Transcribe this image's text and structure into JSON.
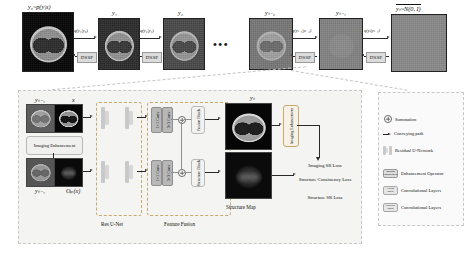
{
  "figure": {
    "top_row": {
      "states": [
        {
          "id": "y0",
          "label": "y₀~p(y|x)"
        },
        {
          "id": "y1",
          "label": "y₁"
        },
        {
          "id": "y2",
          "label": "y₂"
        },
        {
          "id": "yt2",
          "label": "yₜ₋₂"
        },
        {
          "id": "yt1",
          "label": "yₜ₋₁"
        },
        {
          "id": "yT",
          "label": "yₜ~N(0, I)"
        }
      ],
      "forward_labels": [
        "q(y₁|y₀)",
        "q(y₂|y₁)",
        "q(yₜ₋₁|yₜ₋₂)",
        "q(yₜ|yₜ₋₁)"
      ],
      "reverse_label": "DSSP",
      "reverse_labels": [
        "DSSP",
        "DSSP",
        "DSSP",
        "DSSP"
      ],
      "ellipsis": "•••"
    },
    "detail_panel": {
      "inputs": {
        "top_left_label": "yₜ₋₁",
        "top_right_label": "x",
        "bottom_left_label": "yₜ₋₁",
        "bottom_right_label": "Oₚ(x)",
        "enhancement_box": "Imaging Enhancement"
      },
      "stages": [
        {
          "name": "res-unet",
          "caption": "Res U-Net"
        },
        {
          "name": "feature-fusion",
          "caption": "Feature Fusion"
        },
        {
          "name": "structure-map",
          "caption": "Structure Map"
        }
      ],
      "conv_blocks": {
        "top": [
          "1×1 Conv",
          "3×3 Conv"
        ],
        "bottom": [
          "1×1 Conv",
          "3×3 Conv"
        ]
      },
      "fusion_blocks": {
        "top": "Fusion Block",
        "bottom": "Structure Block"
      },
      "output_label": "yₜ",
      "imaging_enhancement_vertical": "Imaging Enhancement",
      "losses": [
        "Imaging SR Loss",
        "Structure Consistency Loss",
        "Structure SR Loss"
      ]
    },
    "legend": {
      "items": [
        {
          "icon": "summation-icon",
          "label": "Summation"
        },
        {
          "icon": "arrow-icon",
          "label": "Conveying path"
        },
        {
          "icon": "unet-icon",
          "label": "Residual U-Network"
        },
        {
          "icon": "enhancement-chip-icon",
          "chip": "Imaging Enhancement",
          "label": "Enhancement Operator"
        },
        {
          "icon": "fusion-chip-icon",
          "chip": "Fusion Block",
          "label": "Convolutional Layers"
        },
        {
          "icon": "structure-chip-icon",
          "chip": "Structure Block",
          "label": "Convolutional Layers"
        }
      ]
    },
    "colors": {
      "accent_dashed": "#c9a86a",
      "panel_bg": "#f4f4f2",
      "chip_bg": "#dcdcdc",
      "line": "#2a2a2a"
    }
  }
}
